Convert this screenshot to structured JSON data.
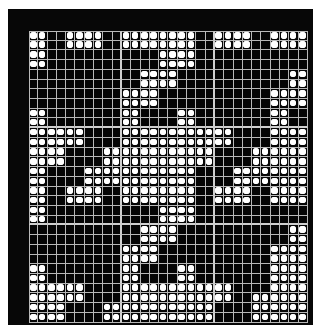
{
  "puzzle": {
    "type": "nonogram-style dot grid",
    "columns": 30,
    "rows": 30,
    "major_grid_every": 10,
    "colors": {
      "frame": "#070707",
      "cell": "#050505",
      "grid_line": "#b8b8b8",
      "dot": "#ffffff",
      "page_background": "#ffffff"
    },
    "filled_cells_by_row": [
      [
        0,
        1,
        4,
        5,
        6,
        7,
        10,
        11,
        12,
        13,
        14,
        15,
        16,
        17,
        20,
        21,
        22,
        23,
        26,
        27,
        28,
        29
      ],
      [
        0,
        1,
        4,
        5,
        6,
        7,
        10,
        11,
        12,
        13,
        14,
        15,
        16,
        17,
        20,
        21,
        22,
        23,
        26,
        27,
        28,
        29
      ],
      [
        0,
        1,
        14,
        15,
        16,
        17
      ],
      [
        0,
        1,
        14,
        15,
        16,
        17
      ],
      [
        12,
        13,
        14,
        15,
        28,
        29
      ],
      [
        12,
        13,
        14,
        15,
        28,
        29
      ],
      [
        10,
        11,
        12,
        13,
        26,
        27,
        28,
        29
      ],
      [
        10,
        11,
        12,
        13,
        26,
        27,
        28,
        29
      ],
      [
        0,
        1,
        10,
        11,
        16,
        17,
        26,
        27
      ],
      [
        0,
        1,
        10,
        11,
        16,
        17,
        26,
        27
      ],
      [
        0,
        1,
        2,
        3,
        4,
        5,
        10,
        11,
        12,
        13,
        14,
        15,
        16,
        17,
        18,
        19,
        20,
        21,
        26,
        27,
        28,
        29
      ],
      [
        0,
        1,
        2,
        3,
        4,
        5,
        10,
        11,
        12,
        13,
        14,
        15,
        16,
        17,
        18,
        19,
        20,
        21,
        26,
        27,
        28,
        29
      ],
      [
        0,
        1,
        2,
        3,
        8,
        9,
        10,
        11,
        12,
        13,
        14,
        15,
        16,
        17,
        18,
        19,
        24,
        25,
        26,
        27,
        28,
        29
      ],
      [
        0,
        1,
        2,
        3,
        8,
        9,
        10,
        11,
        12,
        13,
        14,
        15,
        16,
        17,
        18,
        19,
        24,
        25,
        26,
        27,
        28,
        29
      ],
      [
        0,
        1,
        6,
        7,
        8,
        9,
        10,
        11,
        12,
        13,
        14,
        15,
        16,
        17,
        22,
        23,
        24,
        25,
        26,
        27,
        28,
        29
      ],
      [
        0,
        1,
        6,
        7,
        8,
        9,
        10,
        11,
        12,
        13,
        14,
        15,
        16,
        17,
        22,
        23,
        24,
        25,
        26,
        27,
        28,
        29
      ],
      [
        0,
        1,
        4,
        5,
        6,
        7,
        10,
        11,
        12,
        13,
        14,
        15,
        16,
        17,
        20,
        21,
        22,
        23,
        26,
        27,
        28,
        29
      ],
      [
        0,
        1,
        4,
        5,
        6,
        7,
        10,
        11,
        12,
        13,
        14,
        15,
        16,
        17,
        20,
        21,
        22,
        23,
        26,
        27,
        28,
        29
      ],
      [
        0,
        1,
        14,
        15,
        16,
        17
      ],
      [
        0,
        1,
        14,
        15,
        16,
        17
      ],
      [
        12,
        13,
        14,
        15,
        28,
        29
      ],
      [
        12,
        13,
        14,
        15,
        28,
        29
      ],
      [
        10,
        11,
        12,
        13,
        26,
        27,
        28,
        29
      ],
      [
        10,
        11,
        12,
        13,
        26,
        27,
        28,
        29
      ],
      [
        0,
        1,
        10,
        11,
        16,
        17,
        26,
        27,
        28,
        29
      ],
      [
        0,
        1,
        10,
        11,
        16,
        17,
        26,
        27,
        28,
        29
      ],
      [
        0,
        1,
        2,
        3,
        4,
        5,
        10,
        11,
        12,
        13,
        14,
        15,
        16,
        17,
        18,
        19,
        20,
        21,
        26,
        27,
        28,
        29
      ],
      [
        0,
        1,
        2,
        3,
        4,
        5,
        10,
        11,
        12,
        13,
        14,
        15,
        16,
        17,
        18,
        19,
        20,
        21,
        24,
        25,
        26,
        27,
        28,
        29
      ],
      [
        0,
        1,
        2,
        3,
        8,
        9,
        10,
        11,
        12,
        13,
        14,
        15,
        16,
        17,
        18,
        19,
        24,
        25,
        26,
        27,
        28,
        29
      ],
      [
        0,
        1,
        2,
        3,
        8,
        9,
        10,
        11,
        12,
        13,
        14,
        15,
        16,
        17,
        18,
        19,
        24,
        25,
        26,
        27,
        28,
        29
      ]
    ]
  }
}
